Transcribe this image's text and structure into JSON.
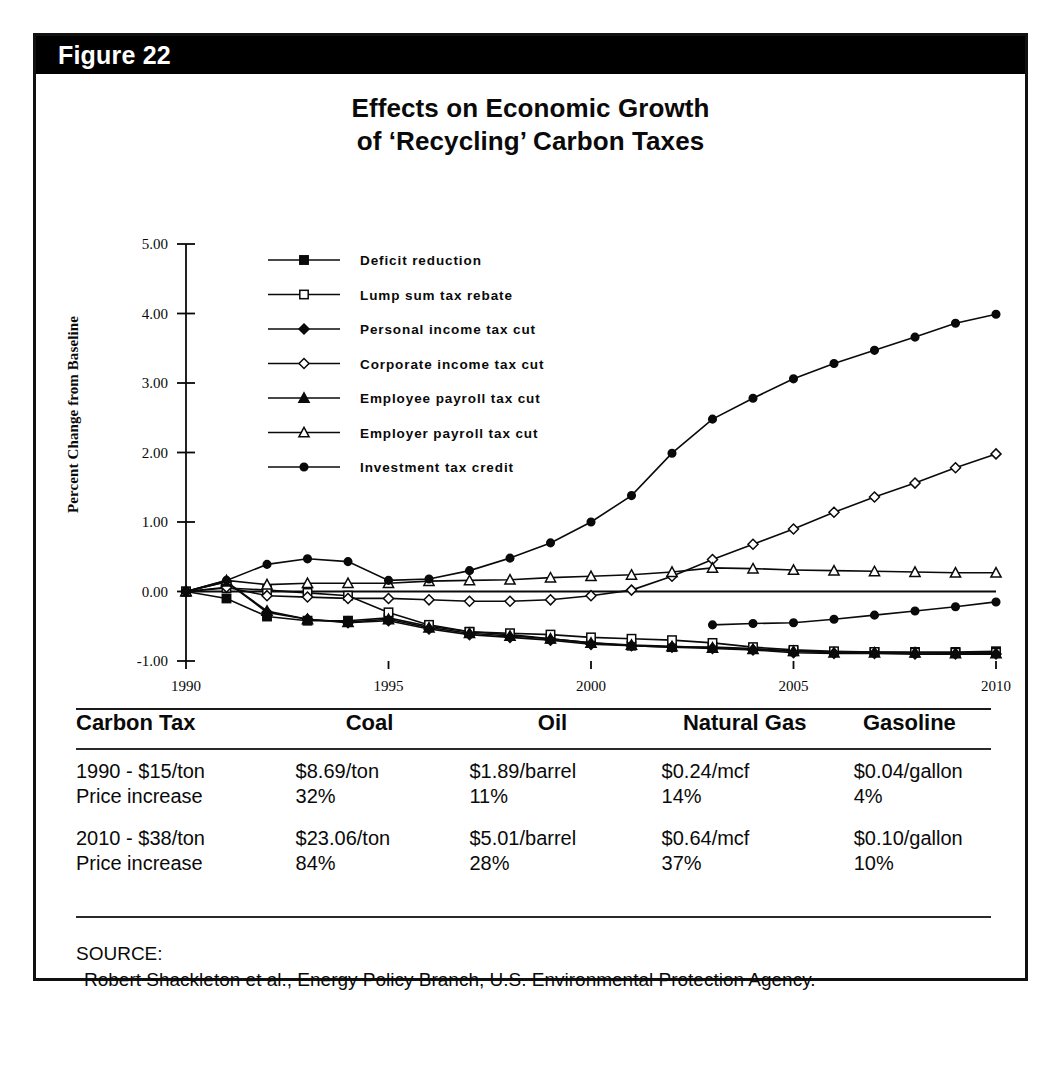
{
  "figure": {
    "label": "Figure 22",
    "title_line1": "Effects on Economic Growth",
    "title_line2": "of ‘Recycling’ Carbon Taxes"
  },
  "chart_data": {
    "type": "line",
    "xlabel": "",
    "ylabel": "Percent Change from Baseline",
    "xlim": [
      1990,
      2010
    ],
    "ylim": [
      -1.0,
      5.0
    ],
    "yticks": [
      "5.00",
      "4.00",
      "3.00",
      "2.00",
      "1.00",
      "0.00",
      "-1.00"
    ],
    "ytick_values": [
      5.0,
      4.0,
      3.0,
      2.0,
      1.0,
      0.0,
      -1.0
    ],
    "xticks": [
      "1990",
      "1995",
      "2000",
      "2005",
      "2010"
    ],
    "xtick_values": [
      1990,
      1995,
      2000,
      2005,
      2010
    ],
    "grid": false,
    "legend_position": "upper-left-inside",
    "x": [
      1990,
      1991,
      1992,
      1993,
      1994,
      1995,
      1996,
      1997,
      1998,
      1999,
      2000,
      2001,
      2002,
      2003,
      2004,
      2005,
      2006,
      2007,
      2008,
      2009,
      2010
    ],
    "series": [
      {
        "name": "Deficit reduction",
        "marker": "filled-square",
        "values": [
          0.0,
          -0.1,
          -0.36,
          -0.42,
          -0.42,
          -0.38,
          -0.5,
          -0.58,
          -0.62,
          -0.68,
          -0.74,
          -0.78,
          -0.8,
          -0.8,
          -0.82,
          -0.86,
          -0.87,
          -0.87,
          -0.87,
          -0.87,
          -0.86
        ]
      },
      {
        "name": "Lump sum tax rebate",
        "marker": "open-square",
        "values": [
          0.0,
          0.05,
          0.02,
          -0.02,
          -0.06,
          -0.3,
          -0.48,
          -0.58,
          -0.6,
          -0.62,
          -0.66,
          -0.68,
          -0.7,
          -0.74,
          -0.8,
          -0.84,
          -0.86,
          -0.87,
          -0.88,
          -0.88,
          -0.88
        ]
      },
      {
        "name": "Personal income tax cut",
        "marker": "filled-diamond",
        "values": [
          0.0,
          0.14,
          -0.3,
          -0.4,
          -0.45,
          -0.42,
          -0.54,
          -0.62,
          -0.66,
          -0.7,
          -0.76,
          -0.78,
          -0.8,
          -0.82,
          -0.84,
          -0.88,
          -0.89,
          -0.89,
          -0.9,
          -0.9,
          -0.9
        ]
      },
      {
        "name": "Corporate income tax cut",
        "marker": "open-diamond",
        "values": [
          0.0,
          0.06,
          -0.06,
          -0.08,
          -0.1,
          -0.1,
          -0.12,
          -0.14,
          -0.14,
          -0.12,
          -0.06,
          0.02,
          0.22,
          0.46,
          0.68,
          0.9,
          1.14,
          1.36,
          1.56,
          1.78,
          1.98
        ]
      },
      {
        "name": "Employee payroll tax cut",
        "marker": "filled-triangle",
        "values": [
          0.0,
          0.14,
          -0.28,
          -0.4,
          -0.44,
          -0.4,
          -0.52,
          -0.6,
          -0.64,
          -0.68,
          -0.74,
          -0.77,
          -0.79,
          -0.81,
          -0.83,
          -0.86,
          -0.88,
          -0.88,
          -0.88,
          -0.89,
          -0.89
        ]
      },
      {
        "name": "Employer payroll tax cut",
        "marker": "open-triangle",
        "values": [
          0.0,
          0.16,
          0.1,
          0.12,
          0.12,
          0.12,
          0.15,
          0.16,
          0.17,
          0.2,
          0.22,
          0.24,
          0.28,
          0.34,
          0.33,
          0.31,
          0.3,
          0.29,
          0.28,
          0.27,
          0.27
        ]
      },
      {
        "name": "Investment tax credit",
        "marker": "filled-circle",
        "values": [
          0.0,
          0.16,
          0.39,
          0.47,
          0.43,
          0.16,
          0.18,
          0.3,
          0.48,
          0.7,
          1.0,
          1.38,
          1.99,
          2.48,
          2.78,
          3.06,
          3.28,
          3.47,
          3.66,
          3.86,
          3.99
        ]
      },
      {
        "name": "Investment tax credit lower branch",
        "marker": "filled-circle",
        "values": [
          null,
          null,
          null,
          null,
          null,
          null,
          null,
          null,
          null,
          null,
          null,
          null,
          null,
          -0.48,
          -0.46,
          -0.45,
          -0.4,
          -0.34,
          -0.28,
          -0.22,
          -0.15
        ]
      }
    ],
    "legend": [
      {
        "label": "Deficit reduction",
        "marker": "filled-square"
      },
      {
        "label": "Lump sum tax rebate",
        "marker": "open-square"
      },
      {
        "label": "Personal income tax cut",
        "marker": "filled-diamond"
      },
      {
        "label": "Corporate income tax cut",
        "marker": "open-diamond"
      },
      {
        "label": "Employee payroll tax cut",
        "marker": "filled-triangle"
      },
      {
        "label": "Employer payroll tax cut",
        "marker": "open-triangle"
      },
      {
        "label": "Investment tax credit",
        "marker": "filled-circle"
      }
    ]
  },
  "table": {
    "headers": [
      "Carbon Tax",
      "Coal",
      "Oil",
      "Natural Gas",
      "Gasoline"
    ],
    "groups": [
      {
        "rows": [
          [
            "1990 - $15/ton",
            "$8.69/ton",
            "$1.89/barrel",
            "$0.24/mcf",
            "$0.04/gallon"
          ],
          [
            "Price increase",
            "32%",
            "11%",
            "14%",
            "4%"
          ]
        ]
      },
      {
        "rows": [
          [
            "2010 - $38/ton",
            "$23.06/ton",
            "$5.01/barrel",
            "$0.64/mcf",
            "$0.10/gallon"
          ],
          [
            "Price increase",
            "84%",
            "28%",
            "37%",
            "10%"
          ]
        ]
      }
    ]
  },
  "source": {
    "label": "SOURCE:",
    "text": "Robert Shackleton et al., Energy Policy Branch, U.S. Environmental Protection Agency."
  },
  "colors": {
    "header_bar": "#000000",
    "header_text": "#ffffff",
    "ink": "#0a0a0a",
    "paper": "#ffffff"
  }
}
